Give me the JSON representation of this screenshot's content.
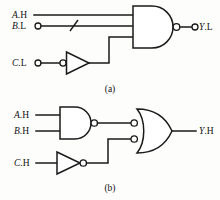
{
  "figure": {
    "background_color": "#fdfdfc",
    "line_color": "#1a1a1a",
    "panels": [
      {
        "id": "a",
        "caption": "(a)",
        "gates": [
          {
            "name": "nand-gate",
            "type": "NAND",
            "inputs": 3,
            "output_bubble": true
          },
          {
            "name": "inverter-gate",
            "type": "INVERTER",
            "inputs": 1,
            "input_bubble": true
          }
        ],
        "inputs": [
          {
            "name": "A.H",
            "var": "A",
            "suffix": ".H",
            "terminal": false,
            "slash": false
          },
          {
            "name": "B.L",
            "var": "B",
            "suffix": ".L",
            "terminal": true,
            "slash": true
          },
          {
            "name": "C.L",
            "var": "C",
            "suffix": ".L",
            "terminal": true,
            "slash": false
          }
        ],
        "outputs": [
          {
            "name": "Y.L",
            "var": "Y",
            "suffix": ".L",
            "terminal": true
          }
        ]
      },
      {
        "id": "b",
        "caption": "(b)",
        "gates": [
          {
            "name": "nand-gate",
            "type": "NAND",
            "inputs": 2,
            "output_bubble": true
          },
          {
            "name": "or-gate",
            "type": "OR",
            "inputs": 2,
            "input_bubbles": true
          },
          {
            "name": "inverter-gate",
            "type": "INVERTER",
            "inputs": 1,
            "output_bubble": true
          }
        ],
        "inputs": [
          {
            "name": "A.H",
            "var": "A",
            "suffix": ".H",
            "terminal": false,
            "slash": false
          },
          {
            "name": "B.H",
            "var": "B",
            "suffix": ".H",
            "terminal": false,
            "slash": false
          },
          {
            "name": "C.H",
            "var": "C",
            "suffix": ".H",
            "terminal": false,
            "slash": false
          }
        ],
        "outputs": [
          {
            "name": "Y.H",
            "var": "Y",
            "suffix": ".H",
            "terminal": false
          }
        ]
      }
    ]
  },
  "labels": {
    "a_in_1_var": "A",
    "a_in_1_suffix": ".H",
    "a_in_2_var": "B",
    "a_in_2_suffix": ".L",
    "a_in_3_var": "C",
    "a_in_3_suffix": ".L",
    "a_out_var": "Y",
    "a_out_suffix": ".L",
    "a_caption": "(a)",
    "b_in_1_var": "A",
    "b_in_1_suffix": ".H",
    "b_in_2_var": "B",
    "b_in_2_suffix": ".H",
    "b_in_3_var": "C",
    "b_in_3_suffix": ".H",
    "b_out_var": "Y",
    "b_out_suffix": ".H",
    "b_caption": "(b)"
  }
}
